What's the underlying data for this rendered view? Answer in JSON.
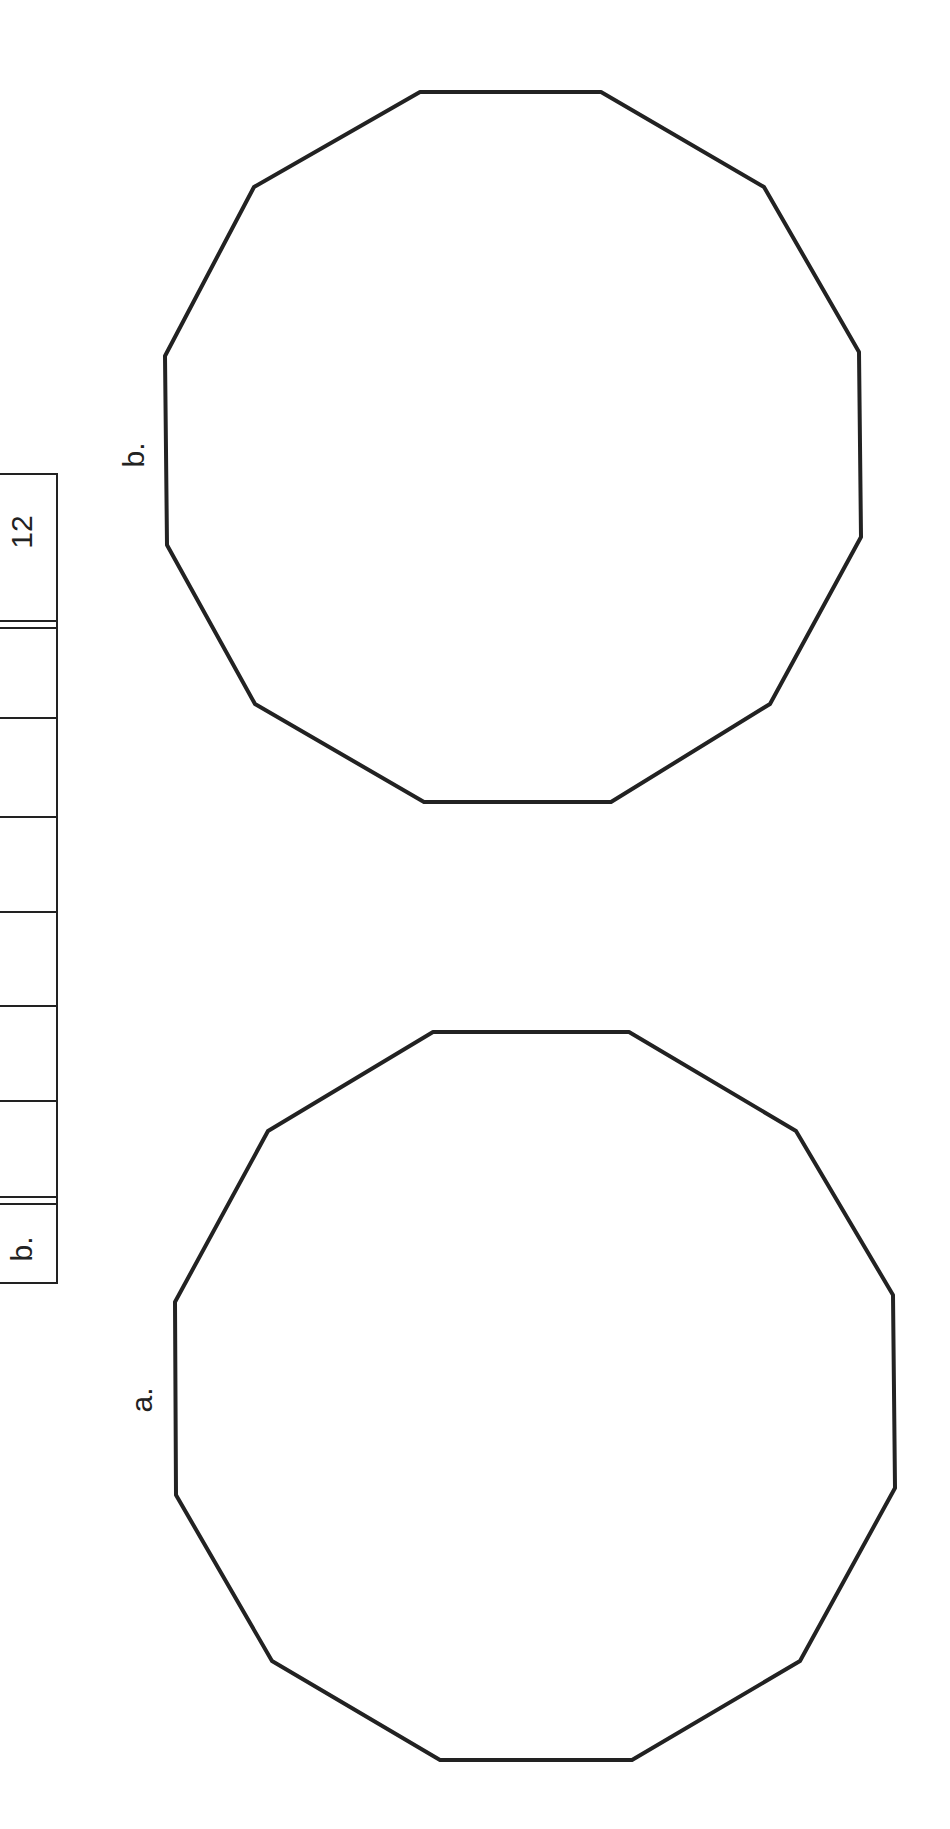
{
  "table": {
    "header_label": "12",
    "row_label": "b.",
    "cell_count": 6
  },
  "figures": [
    {
      "label": "b.",
      "shape": "decagon"
    },
    {
      "label": "a.",
      "shape": "decagon"
    }
  ],
  "colors": {
    "stroke": "#222222",
    "background": "#ffffff"
  }
}
